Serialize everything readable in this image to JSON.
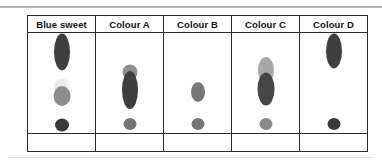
{
  "figure": {
    "plate_background": "#ffffff",
    "border_color": "#2a2a2a",
    "top_rule_color": "#9a9a9a"
  },
  "chart_data": {
    "type": "table",
    "categories": [
      "Blue sweet",
      "Colour A",
      "Colour B",
      "Colour C",
      "Colour D"
    ],
    "xlabel": "Sample lane",
    "ylabel": "Distance travelled",
    "grid": false,
    "legend": "none",
    "lanes": [
      {
        "label": "Blue sweet",
        "spot_count": 4,
        "spots": [
          {
            "name": "dark-tall-spot",
            "rf": 0.84,
            "color": "#3f3f3f",
            "shape": "ellipse",
            "width": 16,
            "height": 37
          },
          {
            "name": "faint-pale-spot",
            "rf": 0.47,
            "color": "#ededed",
            "shape": "ellipse",
            "width": 16,
            "height": 15
          },
          {
            "name": "mid-grey-spot",
            "rf": 0.36,
            "color": "#8e8e8e",
            "shape": "ellipse",
            "width": 17,
            "height": 20
          },
          {
            "name": "baseline-dark-spot",
            "rf": 0.04,
            "color": "#3b3b3b",
            "shape": "circle",
            "width": 14,
            "height": 13
          }
        ]
      },
      {
        "label": "Colour A",
        "spot_count": 3,
        "spots": [
          {
            "name": "mid-grey-spot",
            "rf": 0.62,
            "color": "#8d8d8d",
            "shape": "ellipse",
            "width": 15,
            "height": 15
          },
          {
            "name": "dark-tall-spot",
            "rf": 0.42,
            "color": "#3f3f3f",
            "shape": "ellipse",
            "width": 16,
            "height": 38
          },
          {
            "name": "baseline-grey-spot",
            "rf": 0.05,
            "color": "#777777",
            "shape": "circle",
            "width": 13,
            "height": 12
          }
        ]
      },
      {
        "label": "Colour B",
        "spot_count": 2,
        "spots": [
          {
            "name": "mid-grey-spot",
            "rf": 0.4,
            "color": "#777777",
            "shape": "ellipse",
            "width": 14,
            "height": 20
          },
          {
            "name": "baseline-grey-spot",
            "rf": 0.05,
            "color": "#777777",
            "shape": "circle",
            "width": 13,
            "height": 12
          }
        ]
      },
      {
        "label": "Colour C",
        "spot_count": 3,
        "spots": [
          {
            "name": "light-grey-spot",
            "rf": 0.64,
            "color": "#a9a9a9",
            "shape": "ellipse",
            "width": 16,
            "height": 26
          },
          {
            "name": "dark-tall-spot",
            "rf": 0.43,
            "color": "#464646",
            "shape": "ellipse",
            "width": 17,
            "height": 33
          },
          {
            "name": "baseline-grey-spot",
            "rf": 0.05,
            "color": "#8a8a8a",
            "shape": "circle",
            "width": 13,
            "height": 12
          }
        ]
      },
      {
        "label": "Colour D",
        "spot_count": 2,
        "spots": [
          {
            "name": "dark-tall-spot",
            "rf": 0.85,
            "color": "#3f3f3f",
            "shape": "ellipse",
            "width": 16,
            "height": 35
          },
          {
            "name": "baseline-dark-spot",
            "rf": 0.05,
            "color": "#3b3b3b",
            "shape": "circle",
            "width": 13,
            "height": 12
          }
        ]
      }
    ]
  }
}
